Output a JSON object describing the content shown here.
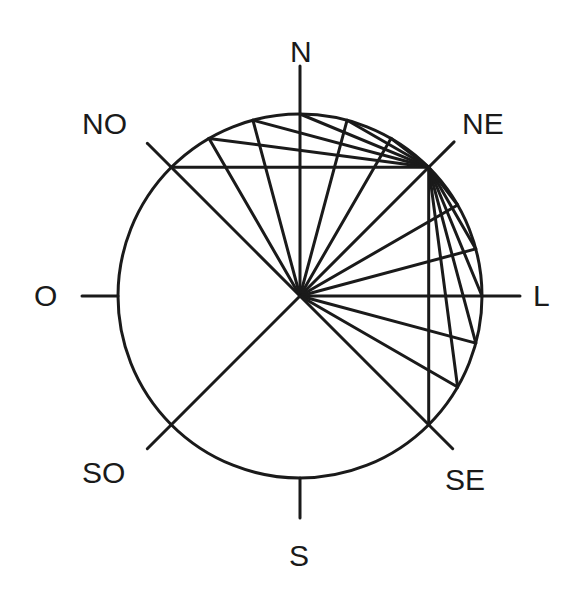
{
  "diagram": {
    "type": "compass-rose-construction",
    "center": [
      300,
      296
    ],
    "radius": 182,
    "stroke_color": "#1a1a1a",
    "background": "#ffffff",
    "labels": {
      "N": "N",
      "NE": "NE",
      "L": "L",
      "SE": "SE",
      "S": "S",
      "SO": "SO",
      "O": "O",
      "NO": "NO"
    },
    "spoke_step_degrees": 15,
    "spokes_arc": {
      "from": "NO",
      "to": "SE",
      "direction": "clockwise"
    },
    "chords_from": "NE",
    "chords_arc": {
      "from": "NO",
      "to": "SE"
    },
    "extra_diameter": {
      "from": "NE",
      "to": "SO"
    }
  }
}
